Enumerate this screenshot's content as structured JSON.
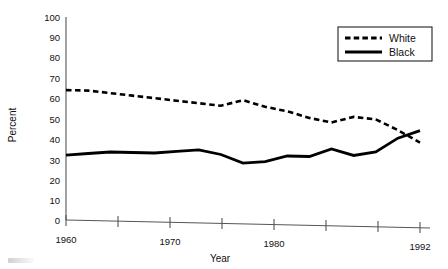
{
  "chart_data": {
    "type": "line",
    "title": "",
    "subtitle": "",
    "xlabel": "Year",
    "ylabel": "Percent",
    "xlim": [
      1960,
      1992
    ],
    "ylim": [
      0,
      100
    ],
    "grid": false,
    "legend_position": "top-right",
    "xticks": [
      1960,
      1965,
      1970,
      1975,
      1980,
      1985,
      1990,
      1992
    ],
    "xticklabels": [
      "1960",
      "",
      "1970",
      "",
      "1980",
      "",
      "",
      "1992"
    ],
    "yticks": [
      0,
      10,
      20,
      30,
      40,
      50,
      60,
      70,
      80,
      90,
      100
    ],
    "yticklabels": [
      "0",
      "10",
      "20",
      "30",
      "40",
      "50",
      "60",
      "70",
      "80",
      "90",
      "100"
    ],
    "x": [
      1960,
      1962,
      1964,
      1966,
      1968,
      1970,
      1972,
      1974,
      1976,
      1978,
      1980,
      1982,
      1984,
      1986,
      1988,
      1990,
      1992
    ],
    "series": [
      {
        "name": "White",
        "style": "dashed",
        "color": "#000000",
        "values": [
          64,
          64,
          63,
          62,
          61,
          60,
          59,
          58,
          61,
          58,
          56,
          53,
          51,
          54,
          53,
          48,
          42
        ]
      },
      {
        "name": "Black",
        "style": "solid",
        "color": "#000000",
        "values": [
          32,
          33,
          34,
          34,
          34,
          35,
          36,
          34,
          30,
          31,
          34,
          34,
          38,
          35,
          37,
          44,
          48
        ]
      }
    ],
    "annotations": []
  },
  "axes": {
    "y_axis_title": "Percent",
    "x_axis_title": "Year"
  },
  "legend": {
    "entries": [
      {
        "label": "White",
        "style": "dashed"
      },
      {
        "label": "Black",
        "style": "solid"
      }
    ]
  }
}
